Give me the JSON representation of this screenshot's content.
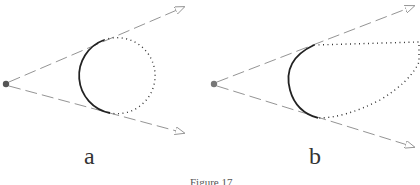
{
  "panels": [
    {
      "label": "a",
      "shape": "circle"
    },
    {
      "label": "b",
      "shape": "convex-extended"
    }
  ],
  "caption": "Figure 17",
  "colors": {
    "ray": "#888888",
    "visible_arc": "#222222",
    "hidden_dots": "#333333",
    "point": "#555555"
  }
}
